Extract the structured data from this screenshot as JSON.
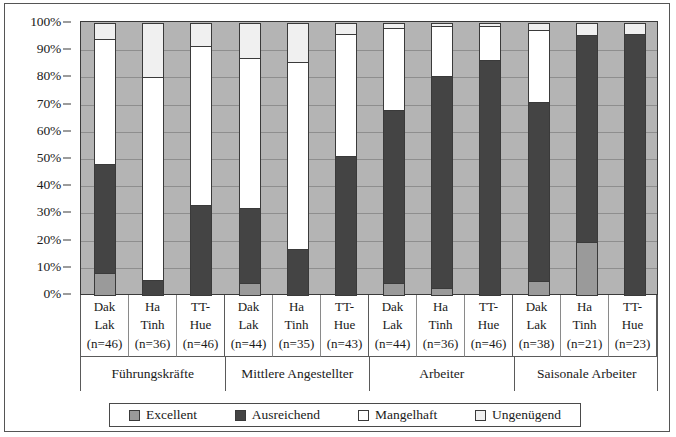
{
  "chart_data": {
    "type": "bar",
    "subtype": "stacked-percent",
    "title": "",
    "xlabel": "",
    "ylabel": "",
    "ylim": [
      0,
      100
    ],
    "yticks": [
      "0%",
      "10%",
      "20%",
      "30%",
      "40%",
      "50%",
      "60%",
      "70%",
      "80%",
      "90%",
      "100%"
    ],
    "ytick_values": [
      0,
      10,
      20,
      30,
      40,
      50,
      60,
      70,
      80,
      90,
      100
    ],
    "grid": true,
    "legend_position": "bottom",
    "legend": [
      "Excellent",
      "Ausreichend",
      "Mangelhaft",
      "Ungenügend"
    ],
    "series": [
      {
        "name": "Excellent",
        "color": "#9a9a9a",
        "values": [
          8.0,
          0.0,
          0.0,
          4.5,
          0.0,
          0.0,
          4.5,
          2.5,
          0.0,
          5.0,
          19.5,
          0.0
        ]
      },
      {
        "name": "Ausreichend",
        "color": "#444444",
        "values": [
          40.0,
          5.5,
          33.0,
          27.5,
          17.0,
          51.0,
          63.5,
          78.0,
          86.5,
          66.0,
          76.0,
          96.0
        ]
      },
      {
        "name": "Mangelhaft",
        "color": "#ffffff",
        "values": [
          46.0,
          74.5,
          58.5,
          55.0,
          68.5,
          45.0,
          30.0,
          18.5,
          12.5,
          26.5,
          0.0,
          0.0
        ]
      },
      {
        "name": "Ungenügend",
        "color": "#f0f0f0",
        "values": [
          6.0,
          20.0,
          8.5,
          13.0,
          14.5,
          4.0,
          2.0,
          1.0,
          1.0,
          2.5,
          4.5,
          4.0
        ]
      }
    ],
    "cumulative_tops": [
      [
        8.0,
        48.0,
        94.0,
        100.0
      ],
      [
        0.0,
        5.5,
        80.0,
        100.0
      ],
      [
        0.0,
        33.0,
        91.5,
        100.0
      ],
      [
        4.5,
        32.0,
        87.0,
        100.0
      ],
      [
        0.0,
        17.0,
        85.5,
        100.0
      ],
      [
        0.0,
        51.0,
        96.0,
        100.0
      ],
      [
        4.5,
        68.0,
        98.0,
        100.0
      ],
      [
        2.5,
        80.5,
        99.0,
        100.0
      ],
      [
        0.0,
        86.5,
        99.0,
        100.0
      ],
      [
        5.0,
        71.0,
        97.5,
        100.0
      ],
      [
        19.5,
        95.5,
        95.5,
        100.0
      ],
      [
        0.0,
        96.0,
        96.0,
        100.0
      ]
    ],
    "categories": [
      {
        "line1": "Dak",
        "line2": "Lak",
        "line3": "(n=46)"
      },
      {
        "line1": "Ha",
        "line2": "Tinh",
        "line3": "(n=36)"
      },
      {
        "line1": "TT-",
        "line2": "Hue",
        "line3": "(n=46)"
      },
      {
        "line1": "Dak",
        "line2": "Lak",
        "line3": "(n=44)"
      },
      {
        "line1": "Ha",
        "line2": "Tinh",
        "line3": "(n=35)"
      },
      {
        "line1": "TT-",
        "line2": "Hue",
        "line3": "(n=43)"
      },
      {
        "line1": "Dak",
        "line2": "Lak",
        "line3": "(n=44)"
      },
      {
        "line1": "Ha",
        "line2": "Tinh",
        "line3": "(n=36)"
      },
      {
        "line1": "TT-",
        "line2": "Hue",
        "line3": "(n=46)"
      },
      {
        "line1": "Dak",
        "line2": "Lak",
        "line3": "(n=38)"
      },
      {
        "line1": "Ha",
        "line2": "Tinh",
        "line3": "(n=21)"
      },
      {
        "line1": "TT-",
        "line2": "Hue",
        "line3": "(n=23)"
      }
    ],
    "groups": [
      {
        "label": "Führungskräfte",
        "span": 3
      },
      {
        "label": "Mittlere Angestellter",
        "span": 3
      },
      {
        "label": "Arbeiter",
        "span": 3
      },
      {
        "label": "Saisonale Arbeiter",
        "span": 3
      }
    ]
  },
  "colors": {
    "plot_background": "#b4b4b4",
    "gridline": "#8e8e8e",
    "axis": "#3a3a3a",
    "excellent": "#9a9a9a",
    "ausreichend": "#444444",
    "mangelhaft": "#ffffff",
    "ungenuegend": "#f0f0f0"
  }
}
